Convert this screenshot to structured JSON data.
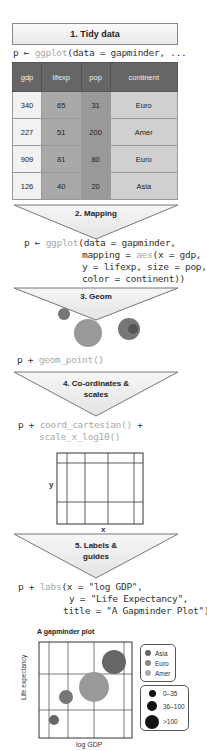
{
  "steps": [
    {
      "label": "1. Tidy data"
    },
    {
      "label": "2. Mapping"
    },
    {
      "label": "3. Geom"
    },
    {
      "label": "4. Co-ordinates &",
      "label2": "scales"
    },
    {
      "label": "5. Labels &",
      "label2": "guides"
    }
  ],
  "code": {
    "tidy": {
      "prefix": "p ← ",
      "fn": "ggplot",
      "rest": "(data = gapminder, ..."
    },
    "mapping": {
      "line1_prefix": "p ← ",
      "line1_fn": "ggplot",
      "line1_rest": "(data = gapminder,",
      "line2_pre": "mapping = ",
      "line2_fn": "aes",
      "line2_rest": "(x = gdp,",
      "line3": "y = lifexp, size = pop,",
      "line4": "color = continent))"
    },
    "geom": {
      "prefix": "p + ",
      "fn": "geom_point()"
    },
    "coords": {
      "prefix": "p + ",
      "line1_fn": "coord_cartesian()",
      "line1_rest": " +",
      "line2_fn": "scale_x_log10()"
    },
    "labels": {
      "prefix": "p + ",
      "fn": "labs",
      "line1_rest": "(x = \"log GDP\",",
      "line2": "y = \"Life Expectancy\",",
      "line3": "title = \"A Gapminder Plot\")"
    }
  },
  "table": {
    "headers": [
      "gdp",
      "lifexp",
      "pop",
      "continent"
    ],
    "rows": [
      [
        "340",
        "65",
        "31",
        "Euro"
      ],
      [
        "227",
        "51",
        "200",
        "Amer"
      ],
      [
        "909",
        "81",
        "80",
        "Euro"
      ],
      [
        "126",
        "40",
        "20",
        "Asia"
      ]
    ]
  },
  "coord_panel": {
    "x_label": "x",
    "y_label": "y"
  },
  "final_plot": {
    "title": "A gapminder plot",
    "x_label": "log GDP",
    "y_label": "Life expectancy",
    "legend_color": [
      {
        "label": "Asia",
        "color": "#666666"
      },
      {
        "label": "Euro",
        "color": "#888888"
      },
      {
        "label": "Amer",
        "color": "#aaaaaa"
      }
    ],
    "legend_size": [
      {
        "label": "0–35",
        "size": 7
      },
      {
        "label": "36–100",
        "size": 11
      },
      {
        "label": ">100",
        "size": 15
      }
    ]
  },
  "colors": {
    "header_bg": "#666666",
    "point_asia": "#666666",
    "point_euro": "#888888",
    "point_amer": "#aaaaaa"
  }
}
